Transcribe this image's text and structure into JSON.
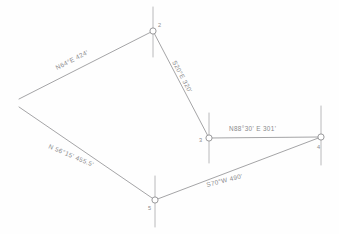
{
  "document": {
    "kind": "survey-traverse-sketch",
    "background_color": "#fefefe",
    "line_color": "#9a9a9c",
    "text_color": "#8a8a8d"
  },
  "stations": [
    {
      "id": "2",
      "label": "2",
      "x": 153,
      "y": 31,
      "label_x": 158,
      "label_y": 27
    },
    {
      "id": "3",
      "label": "3",
      "x": 209,
      "y": 138,
      "label_x": 201,
      "label_y": 142
    },
    {
      "id": "4",
      "label": "4",
      "x": 321,
      "y": 137,
      "label_x": 317,
      "label_y": 148
    },
    {
      "id": "5",
      "label": "5",
      "x": 155,
      "y": 200,
      "label_x": 149,
      "label_y": 209
    }
  ],
  "courses": [
    {
      "name": "course-2-to-west",
      "bearing": "N 64° E",
      "distance": "424'",
      "label": "N64°E  424'",
      "from": "west-open-end-north",
      "to": "2",
      "label_x": 57,
      "label_y": 70,
      "label_rotation": -27
    },
    {
      "name": "course-2-to-3",
      "bearing": "S 20° E",
      "distance": "320'",
      "label": "S20°E  320'",
      "from": "2",
      "to": "3",
      "label_x": 172,
      "label_y": 62,
      "label_rotation": 62
    },
    {
      "name": "course-3-to-4",
      "bearing": "N 88°30' E",
      "distance": "301'",
      "label": "N88°30' E   301'",
      "from": "3",
      "to": "4",
      "label_x": 229,
      "label_y": 131,
      "label_rotation": 0
    },
    {
      "name": "course-4-to-5",
      "bearing": "S 70° W",
      "distance": "490'",
      "label": "S70°W  490'",
      "from": "4",
      "to": "5",
      "label_x": 207,
      "label_y": 187,
      "label_rotation": -14
    },
    {
      "name": "course-5-to-west",
      "bearing": "N 56°15'",
      "distance": "455.5'",
      "label": "N 56°15'   455.5'",
      "from": "5",
      "to": "west-open-end-south",
      "label_x": 48,
      "label_y": 148,
      "label_rotation": 23
    }
  ],
  "open_ends": [
    {
      "name": "west-open-end-north",
      "x": 19,
      "y": 99
    },
    {
      "name": "west-open-end-south",
      "x": 19,
      "y": 107
    }
  ]
}
